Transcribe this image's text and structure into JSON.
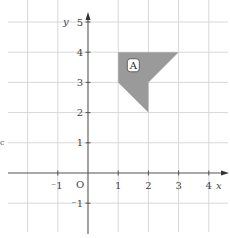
{
  "figure": {
    "type": "coordinate-grid",
    "x_axis": {
      "label": "x",
      "min": -2,
      "max": 4,
      "ticks": [
        {
          "value": -1,
          "label": "-1"
        },
        {
          "value": 1,
          "label": "1"
        },
        {
          "value": 2,
          "label": "2"
        },
        {
          "value": 3,
          "label": "3"
        },
        {
          "value": 4,
          "label": "4"
        }
      ]
    },
    "y_axis": {
      "label": "y",
      "min": -2,
      "max": 5,
      "ticks": [
        {
          "value": 5,
          "label": "5"
        },
        {
          "value": 4,
          "label": "4"
        },
        {
          "value": 3,
          "label": "3"
        },
        {
          "value": 2,
          "label": "2"
        },
        {
          "value": 1,
          "label": "1"
        },
        {
          "value": -1,
          "label": "-1"
        }
      ]
    },
    "origin_label": "O",
    "shapes": [
      {
        "name": "A",
        "label": "A",
        "fill": "#9a9a9a",
        "vertices": [
          [
            1,
            4
          ],
          [
            3,
            4
          ],
          [
            2,
            3
          ],
          [
            2,
            2
          ],
          [
            1,
            3
          ]
        ]
      }
    ],
    "colors": {
      "grid": "#d8d8d8",
      "axis": "#555555",
      "shape_fill": "#9a9a9a"
    },
    "edge_fragment": "c"
  }
}
